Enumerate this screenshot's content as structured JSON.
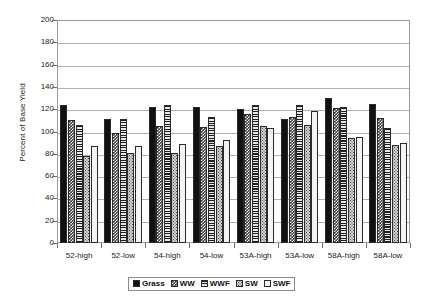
{
  "chart_data": {
    "type": "bar",
    "title": "",
    "xlabel": "",
    "ylabel": "Percent of Base Yield",
    "ylim": [
      0,
      200
    ],
    "ytick_step": 20,
    "yticks": [
      200,
      180,
      160,
      140,
      120,
      100,
      80,
      60,
      40,
      20,
      0
    ],
    "grid": true,
    "legend_position": "bottom-center",
    "categories": [
      "52-high",
      "52-low",
      "54-high",
      "54-low",
      "53A-high",
      "53A-low",
      "58A-high",
      "58A-low"
    ],
    "series": [
      {
        "name": "Grass",
        "pattern": "solid-black",
        "values": [
          124,
          111,
          122,
          122,
          120,
          111,
          130,
          125
        ]
      },
      {
        "name": "WW",
        "pattern": "checkerboard",
        "values": [
          110,
          99,
          105,
          104,
          116,
          113,
          121,
          112
        ]
      },
      {
        "name": "WWF",
        "pattern": "horizontal-lines",
        "values": [
          106,
          111,
          124,
          113,
          124,
          124,
          122,
          103
        ]
      },
      {
        "name": "SW",
        "pattern": "dense-dots",
        "values": [
          78,
          81,
          81,
          87,
          105,
          106,
          94,
          88
        ]
      },
      {
        "name": "SWF",
        "pattern": "sparse-dots",
        "values": [
          87,
          87,
          89,
          92,
          103,
          118,
          95,
          90
        ]
      }
    ]
  },
  "axis": {
    "y_title": "Percent of Base Yield"
  },
  "legend": {
    "entries": [
      {
        "label": "Grass"
      },
      {
        "label": "WW"
      },
      {
        "label": "WWF"
      },
      {
        "label": "SW"
      },
      {
        "label": "SWF"
      }
    ]
  },
  "colors": {
    "axis_line": "#9a9a9a",
    "gridline": "#b3b3b3",
    "text": "#231f20",
    "grass": "#111111",
    "ww": "#3a3a3a",
    "wwf": "#7d7d7d",
    "sw": "#d2d2d2",
    "swf": "#f4f4f4"
  }
}
